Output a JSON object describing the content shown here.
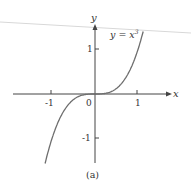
{
  "chart_data": {
    "type": "line",
    "title": "",
    "function_label": "y = x³",
    "function_base": "y = x",
    "function_exp": "3",
    "xlabel": "x",
    "ylabel": "y",
    "caption": "(a)",
    "xlim": [
      -1.3,
      1.15
    ],
    "ylim": [
      -1.55,
      1.55
    ],
    "x_ticks": [
      -1,
      1
    ],
    "x_tick_labels": [
      "-1",
      "1"
    ],
    "y_ticks": [
      -1,
      1
    ],
    "y_tick_labels": [
      "-1",
      "1"
    ],
    "origin_label": "0",
    "grid": false,
    "series": [
      {
        "name": "y = x^3",
        "x": [
          -1.15,
          -1.0,
          -0.8,
          -0.6,
          -0.4,
          -0.2,
          0,
          0.2,
          0.4,
          0.6,
          0.8,
          1.0,
          1.12
        ],
        "y": [
          -1.52,
          -1.0,
          -0.512,
          -0.216,
          -0.064,
          -0.008,
          0,
          0.008,
          0.064,
          0.216,
          0.512,
          1.0,
          1.4
        ]
      }
    ],
    "colors": {
      "curve": "#6e6e6e",
      "axes": "#444444",
      "text": "#333333"
    }
  }
}
